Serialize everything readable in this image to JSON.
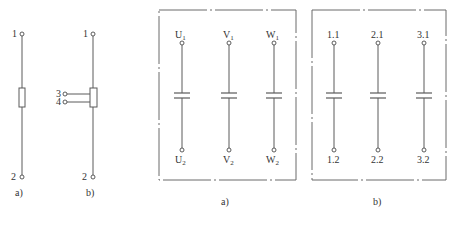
{
  "figure_left": {
    "a": {
      "caption": "a)",
      "terminals": [
        {
          "label": "1",
          "position": "top"
        },
        {
          "label": "2",
          "position": "bottom"
        }
      ],
      "component": "resistor"
    },
    "b": {
      "caption": "b)",
      "terminals": [
        {
          "label": "1",
          "position": "top"
        },
        {
          "label": "2",
          "position": "bottom"
        },
        {
          "label": "3",
          "position": "side"
        },
        {
          "label": "4",
          "position": "side"
        }
      ],
      "component": "resistor-with-taps"
    }
  },
  "figure_right": {
    "a": {
      "caption": "a)",
      "columns": [
        {
          "top": "U",
          "top_sub": "1",
          "bottom": "U",
          "bottom_sub": "2"
        },
        {
          "top": "V",
          "top_sub": "1",
          "bottom": "V",
          "bottom_sub": "2"
        },
        {
          "top": "W",
          "top_sub": "1",
          "bottom": "W",
          "bottom_sub": "2"
        }
      ],
      "component": "capacitor"
    },
    "b": {
      "caption": "b)",
      "columns": [
        {
          "top": "1.1",
          "bottom": "1.2"
        },
        {
          "top": "2.1",
          "bottom": "2.2"
        },
        {
          "top": "3.1",
          "bottom": "3.2"
        }
      ],
      "component": "capacitor"
    }
  },
  "colors": {
    "line": "#5a5a5a",
    "text": "#333333",
    "background": "#ffffff"
  }
}
